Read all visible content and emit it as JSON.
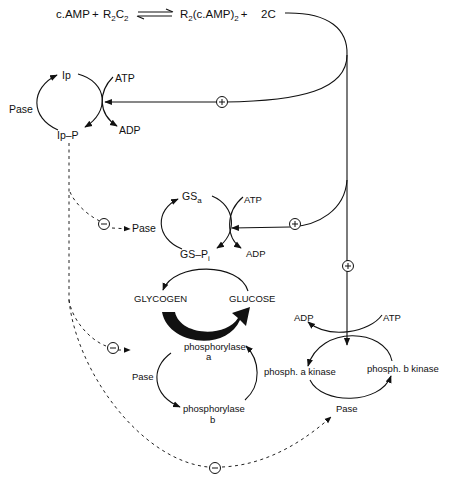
{
  "figure": {
    "top_equation": {
      "reactant1": "c.AMP",
      "plus1": "+",
      "reactant2_base": "R",
      "reactant2_sub1": "2",
      "reactant2_mid": "C",
      "reactant2_sub2": "2",
      "equilibrium_symbol": "⇌",
      "product1_base": "R",
      "product1_sub1": "2",
      "product1_mid": "(c.AMP)",
      "product1_sub2": "2",
      "plus2": "+",
      "product2": "2C"
    },
    "inhibitor_cycle": {
      "top": "Ip",
      "bottom": "Ip–P",
      "left": "Pase",
      "atp": "ATP",
      "adp": "ADP"
    },
    "glycogen_synthase_cycle": {
      "top_base": "GS",
      "top_sub": "a",
      "bottom_base": "GS–P",
      "bottom_sub": "i",
      "left": "Pase",
      "atp": "ATP",
      "adp": "ADP"
    },
    "glycogen_glucose": {
      "left": "GLYCOGEN",
      "right": "GLUCOSE"
    },
    "phosphorylase_cycle": {
      "top_line1": "phosphorylase",
      "top_line2": "a",
      "bottom_line1": "phosphorylase",
      "bottom_line2": "b",
      "left": "Pase"
    },
    "kinase_cycle": {
      "left": "phosph. a kinase",
      "right": "phosph. b kinase",
      "bottom": "Pase",
      "atp": "ATP",
      "adp": "ADP"
    },
    "regulation_signs": {
      "activation": "+",
      "inhibition": "−"
    },
    "colors": {
      "ink": "#111111",
      "background": "#ffffff"
    }
  }
}
